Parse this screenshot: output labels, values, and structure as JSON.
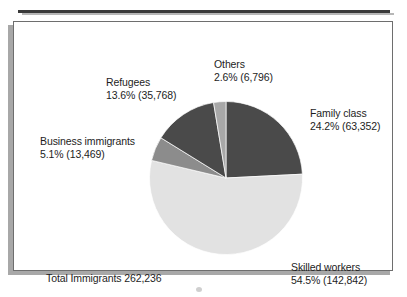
{
  "figure": {
    "total_label": "Total Immigrants 262,236"
  },
  "chart_data": {
    "type": "pie",
    "title": "",
    "subtitle": "",
    "xlabel": "",
    "ylabel": "",
    "legend_position": "none",
    "grid": false,
    "total_label": "Total Immigrants 262,236",
    "total_value": 262236,
    "start_angle_deg": 0,
    "direction": "clockwise",
    "categories": [
      "Family class",
      "Skilled workers",
      "Business immigrants",
      "Refugees",
      "Others"
    ],
    "values": [
      63352,
      142842,
      13469,
      35768,
      6796
    ],
    "percentages": [
      24.2,
      54.5,
      5.1,
      13.6,
      2.6
    ],
    "colors": [
      "#4a4a4a",
      "#e2e2e2",
      "#8c8c8c",
      "#4a4a4a",
      "#a8a8a8"
    ],
    "slices": [
      {
        "name": "Family class",
        "percent": 24.2,
        "value": 63352,
        "color": "#4a4a4a",
        "label_line1": "Family class",
        "label_line2": "24.2%  (63,352)"
      },
      {
        "name": "Skilled workers",
        "percent": 54.5,
        "value": 142842,
        "color": "#e2e2e2",
        "label_line1": "Skilled workers",
        "label_line2": "54.5%  (142,842)"
      },
      {
        "name": "Business immigrants",
        "percent": 5.1,
        "value": 13469,
        "color": "#8c8c8c",
        "label_line1": "Business immigrants",
        "label_line2": "5.1%  (13,469)"
      },
      {
        "name": "Refugees",
        "percent": 13.6,
        "value": 35768,
        "color": "#4a4a4a",
        "label_line1": "Refugees",
        "label_line2": "13.6%  (35,768)"
      },
      {
        "name": "Others",
        "percent": 2.6,
        "value": 6796,
        "color": "#a8a8a8",
        "label_line1": "Others",
        "label_line2": "2.6%  (6,796)"
      }
    ]
  }
}
